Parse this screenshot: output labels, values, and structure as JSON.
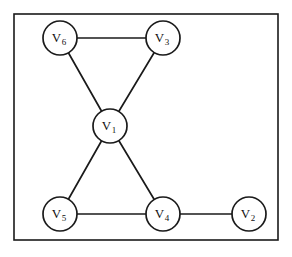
{
  "figure": {
    "kind": "undirected-graph-diagram",
    "background_color": "#ffffff",
    "stroke_color": "#1a1a1a",
    "frame": {
      "x": 14,
      "y": 14,
      "width": 264,
      "height": 226
    },
    "node_radius": 17,
    "nodes": [
      {
        "id": "V1",
        "base": "V",
        "sub": "1",
        "label": "V1",
        "cx": 110,
        "cy": 126
      },
      {
        "id": "V2",
        "base": "V",
        "sub": "2",
        "label": "V2",
        "cx": 249,
        "cy": 214
      },
      {
        "id": "V3",
        "base": "V",
        "sub": "3",
        "label": "V3",
        "cx": 163,
        "cy": 38
      },
      {
        "id": "V4",
        "base": "V",
        "sub": "4",
        "label": "V4",
        "cx": 163,
        "cy": 214
      },
      {
        "id": "V5",
        "base": "V",
        "sub": "5",
        "label": "V5",
        "cx": 60,
        "cy": 214
      },
      {
        "id": "V6",
        "base": "V",
        "sub": "6",
        "label": "V6",
        "cx": 60,
        "cy": 38
      }
    ],
    "edges": [
      {
        "from": "V6",
        "to": "V3"
      },
      {
        "from": "V6",
        "to": "V1"
      },
      {
        "from": "V3",
        "to": "V1"
      },
      {
        "from": "V1",
        "to": "V5"
      },
      {
        "from": "V1",
        "to": "V4"
      },
      {
        "from": "V5",
        "to": "V4"
      },
      {
        "from": "V4",
        "to": "V2"
      }
    ]
  }
}
